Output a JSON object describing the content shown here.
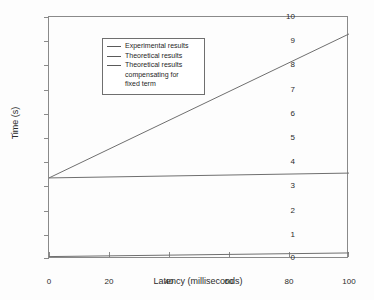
{
  "chart_data": {
    "type": "line",
    "title": "",
    "xlabel": "Latency (milliseconds)",
    "ylabel": "Time (s)",
    "xlim": [
      0,
      100
    ],
    "ylim": [
      0,
      10
    ],
    "xticks": [
      0,
      20,
      40,
      60,
      80,
      100
    ],
    "yticks": [
      0,
      1,
      2,
      3,
      4,
      5,
      6,
      7,
      8,
      9,
      10
    ],
    "grid": false,
    "legend_position": "upper left",
    "series": [
      {
        "name": "Experimental results",
        "x": [
          0,
          100
        ],
        "values": [
          3.35,
          9.3
        ]
      },
      {
        "name": "Theoretical results",
        "x": [
          0,
          100
        ],
        "values": [
          3.35,
          3.55
        ]
      },
      {
        "name": "Theoretical results compensating for fixed term",
        "x": [
          0,
          100
        ],
        "values": [
          0.1,
          0.25
        ]
      }
    ],
    "legend": [
      {
        "line1": "Experimental results",
        "line2": "",
        "line3": ""
      },
      {
        "line1": "Theoretical results",
        "line2": "",
        "line3": ""
      },
      {
        "line1": "Theoretical results",
        "line2": "compensating for",
        "line3": "fixed term"
      }
    ],
    "colors": {
      "line": "#6f6f6f",
      "axis": "#8a8a8a",
      "text": "#2b2b2b",
      "background": "#fdfdfd"
    }
  },
  "axis": {
    "x_tick_labels": [
      "0",
      "20",
      "40",
      "60",
      "80",
      "100"
    ],
    "y_tick_labels": [
      "0",
      "1",
      "2",
      "3",
      "4",
      "5",
      "6",
      "7",
      "8",
      "9",
      "10"
    ]
  }
}
